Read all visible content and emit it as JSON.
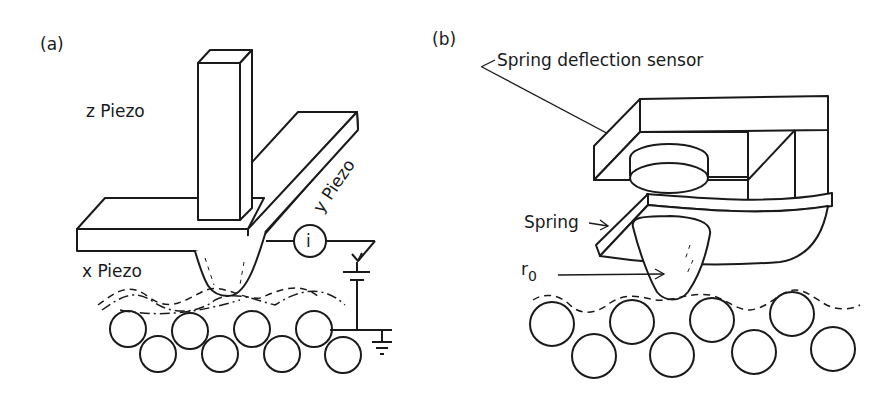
{
  "figure": {
    "panel_a": {
      "label": "(a)",
      "z_piezo": "z Piezo",
      "y_piezo": "y Piezo",
      "x_piezo": "x Piezo",
      "current_meter": "i"
    },
    "panel_b": {
      "label": "(b)",
      "sensor": "Spring deflection sensor",
      "spring": "Spring",
      "tip_radius": "r",
      "tip_radius_sub": "0"
    }
  }
}
